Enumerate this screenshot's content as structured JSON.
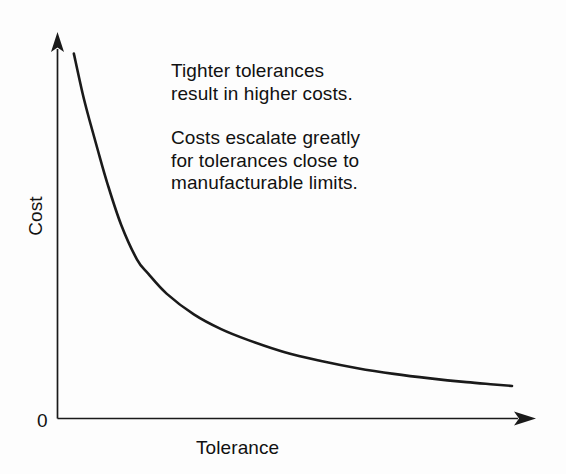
{
  "figure": {
    "background_color": "#fdfdfd",
    "ink_color": "#1a1a1a"
  },
  "annotations": [
    {
      "id": "annotation-1",
      "text": "Tighter tolerances\nresult in higher costs."
    },
    {
      "id": "annotation-2",
      "text": "Costs escalate greatly\nfor tolerances close to\nmanufacturable limits."
    }
  ],
  "labels": {
    "y_axis": "Cost",
    "x_axis": "Tolerance",
    "origin": "0"
  },
  "chart_data": {
    "type": "line",
    "title": "",
    "xlabel": "Tolerance",
    "ylabel": "Cost",
    "origin_label": "0",
    "grid": false,
    "legend": false,
    "axis_style": "arrow-headed",
    "xlim": [
      0,
      1
    ],
    "ylim": [
      0,
      1
    ],
    "tick_labels": {
      "x": [],
      "y": []
    },
    "series": [
      {
        "name": "Cost vs Tolerance",
        "color": "#1a1a1a",
        "line_width": 2.6,
        "x": [
          0.036,
          0.055,
          0.07,
          0.088,
          0.11,
          0.14,
          0.175,
          0.2,
          0.24,
          0.3,
          0.36,
          0.42,
          0.5,
          0.58,
          0.66,
          0.74,
          0.82,
          0.9,
          0.96,
          1.0
        ],
        "y": [
          0.964,
          0.86,
          0.79,
          0.712,
          0.62,
          0.512,
          0.42,
          0.382,
          0.33,
          0.275,
          0.236,
          0.207,
          0.175,
          0.152,
          0.133,
          0.118,
          0.106,
          0.096,
          0.09,
          0.086
        ]
      }
    ],
    "pixel_geometry": {
      "y_axis_x": 57,
      "y_axis_top": 35,
      "x_axis_y": 418.5,
      "x_axis_right": 534,
      "curve_start": [
        74,
        49
      ],
      "curve_end": [
        508,
        403
      ]
    }
  }
}
